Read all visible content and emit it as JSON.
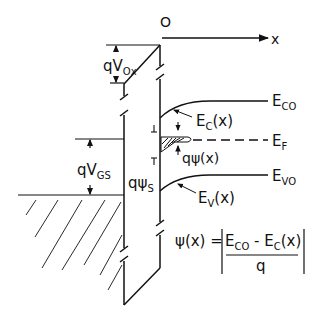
{
  "figure": {
    "axis": {
      "origin_label": "O",
      "x_label": "x"
    },
    "labels": {
      "qVox": {
        "main": "qV",
        "sub": "Ox"
      },
      "qVgs": {
        "main": "qV",
        "sub": "GS"
      },
      "qPsiS": {
        "main": "qψ",
        "sub": "S"
      },
      "qPsiX": "qψ(x)",
      "Ec0": {
        "main": "E",
        "sub": "CO"
      },
      "Ecx": {
        "main": "E",
        "sub": "C",
        "tail": "(x)"
      },
      "Ef": {
        "main": "E",
        "sub": "F"
      },
      "Ev0": {
        "main": "E",
        "sub": "VO"
      },
      "Evx": {
        "main": "E",
        "sub": "V",
        "tail": "(x)"
      }
    },
    "equation": {
      "lhs": "ψ(x) =",
      "numerator_a": {
        "main": "E",
        "sub": "CO"
      },
      "minus": " - ",
      "numerator_b": {
        "main": "E",
        "sub": "C",
        "tail": "(x)"
      },
      "denominator": "q"
    },
    "colors": {
      "ink": "#111111",
      "background": "#ffffff"
    }
  }
}
